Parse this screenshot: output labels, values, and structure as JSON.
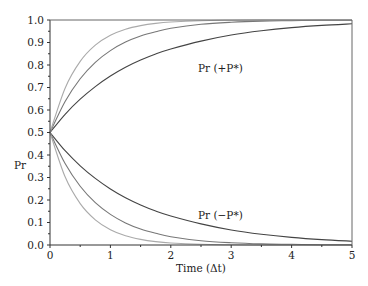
{
  "chart_data": {
    "type": "line",
    "title": "",
    "xlabel": "Time (Δt)",
    "ylabel": "Pr",
    "xlim": [
      0,
      5
    ],
    "ylim": [
      0.0,
      1.0
    ],
    "x_ticks": [
      "0",
      "1",
      "2",
      "3",
      "4",
      "5"
    ],
    "y_ticks": [
      "0.0",
      "0.1",
      "0.2",
      "0.3",
      "0.4",
      "0.5",
      "0.6",
      "0.7",
      "0.8",
      "0.9",
      "1.0"
    ],
    "grid": false,
    "legend": "none",
    "annotations": [
      {
        "text": "Pr (+P*)",
        "x": 2.6,
        "y": 0.87
      },
      {
        "text": "Pr (−P*)",
        "x": 2.6,
        "y": 0.13
      }
    ],
    "x": [
      0,
      0.25,
      0.5,
      0.75,
      1,
      1.25,
      1.5,
      1.75,
      2,
      2.5,
      3,
      3.5,
      4,
      4.5,
      5
    ],
    "series": [
      {
        "name": "Pr (+P*) slow",
        "color": "#444444",
        "values": [
          0.5,
          0.581,
          0.648,
          0.704,
          0.751,
          0.79,
          0.822,
          0.849,
          0.871,
          0.906,
          0.933,
          0.952,
          0.966,
          0.976,
          0.983
        ]
      },
      {
        "name": "Pr (+P*) medium",
        "color": "#777777",
        "values": [
          0.5,
          0.638,
          0.739,
          0.812,
          0.864,
          0.902,
          0.929,
          0.948,
          0.963,
          0.981,
          0.99,
          0.995,
          0.997,
          0.999,
          0.999
        ]
      },
      {
        "name": "Pr (+P*) fast",
        "color": "#aaaaaa",
        "values": [
          0.5,
          0.697,
          0.816,
          0.888,
          0.932,
          0.959,
          0.975,
          0.985,
          0.991,
          0.997,
          0.999,
          1.0,
          1.0,
          1.0,
          1.0
        ]
      },
      {
        "name": "Pr (−P*) slow",
        "color": "#444444",
        "values": [
          0.5,
          0.419,
          0.352,
          0.296,
          0.249,
          0.21,
          0.178,
          0.151,
          0.129,
          0.094,
          0.067,
          0.048,
          0.034,
          0.024,
          0.017
        ]
      },
      {
        "name": "Pr (−P*) medium",
        "color": "#777777",
        "values": [
          0.5,
          0.362,
          0.261,
          0.188,
          0.136,
          0.098,
          0.071,
          0.052,
          0.037,
          0.019,
          0.01,
          0.005,
          0.003,
          0.001,
          0.001
        ]
      },
      {
        "name": "Pr (−P*) fast",
        "color": "#aaaaaa",
        "values": [
          0.5,
          0.303,
          0.184,
          0.112,
          0.068,
          0.041,
          0.025,
          0.015,
          0.009,
          0.003,
          0.001,
          0.0,
          0.0,
          0.0,
          0.0
        ]
      }
    ]
  }
}
